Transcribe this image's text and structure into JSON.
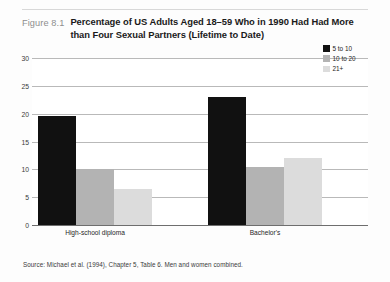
{
  "figure": {
    "number": "Figure 8.1",
    "title_line1": "Percentage of US Adults Aged 18–59 Who in 1990 Had Had More",
    "title_line2": "than Four Sexual Partners (Lifetime to Date)"
  },
  "source_note": "Source: Michael et al. (1994), Chapter 5, Table 6. Men and women combined.",
  "colors": {
    "series_5_to_10": "#111111",
    "series_10_to_20": "#b3b3b3",
    "series_21_plus": "#dcdcdc",
    "gridline": "#b9b9b9",
    "axis": "#6e6e6e",
    "figure_number": "#8e8e8e",
    "title": "#1a1a1a",
    "page_background": "#fdfdfd",
    "plot_background": "#ffffff"
  },
  "chart_data": {
    "type": "bar",
    "title": "Percentage of US Adults Aged 18–59 Who in 1990 Had Had More than Four Sexual Partners (Lifetime to Date)",
    "xlabel": "",
    "ylabel": "",
    "ylim": [
      0,
      30
    ],
    "yticks": [
      "0",
      "5",
      "10",
      "15",
      "20",
      "25",
      "30"
    ],
    "ytick_values": [
      0,
      5,
      10,
      15,
      20,
      25,
      30
    ],
    "grid": true,
    "legend_position": "top-right",
    "categories": [
      "High-school diploma",
      "Bachelor's"
    ],
    "series": [
      {
        "name": "5 to 10",
        "color": "#111111",
        "values": [
          19.5,
          23.0
        ]
      },
      {
        "name": "10 to 20",
        "color": "#b3b3b3",
        "values": [
          10.0,
          10.5
        ]
      },
      {
        "name": "21+",
        "color": "#dcdcdc",
        "values": [
          6.5,
          12.0
        ]
      }
    ]
  }
}
